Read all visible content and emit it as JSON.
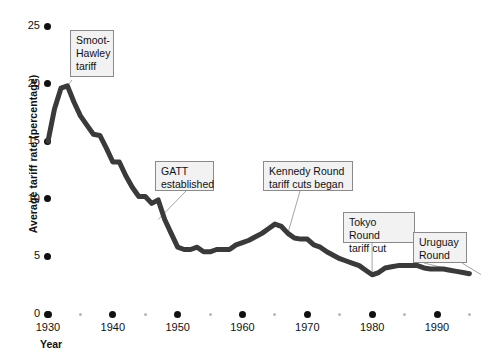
{
  "chart_data": {
    "type": "line",
    "title": "",
    "xlabel": "Year",
    "ylabel": "Average tariff rate (percentage)",
    "xlim": [
      1930,
      1995
    ],
    "ylim": [
      0,
      25
    ],
    "xticks": [
      1930,
      1940,
      1950,
      1960,
      1970,
      1980,
      1990
    ],
    "xtick_labels": [
      "1930",
      "1940",
      "1950",
      "1960",
      "1970",
      "1980",
      "1990"
    ],
    "xticks_minor": [
      1935,
      1945,
      1955,
      1965,
      1975,
      1985,
      1995
    ],
    "yticks": [
      0,
      5,
      10,
      15,
      20,
      25
    ],
    "ytick_labels": [
      "0",
      "5",
      "10",
      "15",
      "20",
      "25"
    ],
    "grid": false,
    "legend": null,
    "line_color": "#3a3a3a",
    "line_width": 5,
    "series": [
      {
        "name": "Average tariff rate",
        "x": [
          1930,
          1931,
          1932,
          1933,
          1934,
          1935,
          1936,
          1937,
          1938,
          1939,
          1940,
          1941,
          1942,
          1943,
          1944,
          1945,
          1946,
          1947,
          1948,
          1949,
          1950,
          1951,
          1952,
          1953,
          1954,
          1955,
          1956,
          1957,
          1958,
          1959,
          1960,
          1961,
          1962,
          1963,
          1964,
          1965,
          1966,
          1967,
          1968,
          1969,
          1970,
          1971,
          1972,
          1973,
          1974,
          1975,
          1976,
          1977,
          1978,
          1979,
          1980,
          1981,
          1982,
          1983,
          1984,
          1985,
          1986,
          1987,
          1988,
          1989,
          1990,
          1991,
          1992,
          1993,
          1994,
          1995
        ],
        "y": [
          15.0,
          17.8,
          19.6,
          19.8,
          18.4,
          17.2,
          16.4,
          15.6,
          15.5,
          14.4,
          13.2,
          13.2,
          12.0,
          11.0,
          10.2,
          10.2,
          9.6,
          9.9,
          8.2,
          7.0,
          5.8,
          5.6,
          5.6,
          5.8,
          5.4,
          5.4,
          5.6,
          5.6,
          5.6,
          6.0,
          6.2,
          6.4,
          6.7,
          7.0,
          7.4,
          7.8,
          7.6,
          7.0,
          6.6,
          6.5,
          6.5,
          6.0,
          5.8,
          5.4,
          5.1,
          4.8,
          4.6,
          4.4,
          4.2,
          3.8,
          3.4,
          3.6,
          4.0,
          4.1,
          4.2,
          4.2,
          4.2,
          4.2,
          4.0,
          3.9,
          3.9,
          3.9,
          3.8,
          3.7,
          3.6,
          3.5
        ]
      }
    ],
    "annotations": [
      {
        "id": "smoot-hawley",
        "text": "Smoot-\nHawley\ntariff",
        "target_x": 1933,
        "target_y": 19.8
      },
      {
        "id": "gatt",
        "text": "GATT\nestablished",
        "target_x": 1947,
        "target_y": 8.2
      },
      {
        "id": "kennedy-round",
        "text": "Kennedy Round\ntariff cuts began",
        "target_x": 1967,
        "target_y": 7.0
      },
      {
        "id": "tokyo-round",
        "text": "Tokyo Round\ntariff cut",
        "target_x": 1980,
        "target_y": 3.4
      },
      {
        "id": "uruguay-round",
        "text": "Uruguay\nRound",
        "target_x": 1994,
        "target_y": 3.6
      }
    ]
  },
  "axis": {
    "y_title": "Average tariff rate (percentage)",
    "x_title": "Year",
    "y_labels": [
      "25",
      "20",
      "15",
      "10",
      "5",
      "0"
    ],
    "x_labels": [
      "1930",
      "1940",
      "1950",
      "1960",
      "1970",
      "1980",
      "1990"
    ]
  },
  "callouts": {
    "smoot_hawley": {
      "line1": "Smoot-",
      "line2": "Hawley",
      "line3": "tariff"
    },
    "gatt": {
      "line1": "GATT",
      "line2": "established"
    },
    "kennedy": {
      "line1": "Kennedy Round",
      "line2": "tariff cuts began"
    },
    "tokyo": {
      "line1": "Tokyo Round",
      "line2": "tariff cut"
    },
    "uruguay": {
      "line1": "Uruguay",
      "line2": "Round"
    }
  },
  "colors": {
    "line": "#3a3a3a",
    "callout_bg": "#f2f2f2",
    "callout_border": "#8a8a8a",
    "leader": "#9a9a9a",
    "tick_major": "#111111",
    "tick_minor": "#b8b8b8"
  }
}
